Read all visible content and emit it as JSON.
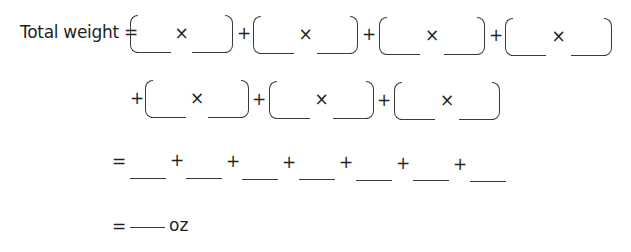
{
  "equation": {
    "label": "Total weight =",
    "times_symbol": "×",
    "plus_symbol": "+",
    "equals_symbol": "=",
    "unit": "oz",
    "row1_groups": 4,
    "row2_groups": 3,
    "row3_blanks": 7,
    "row4_blanks": 1
  }
}
